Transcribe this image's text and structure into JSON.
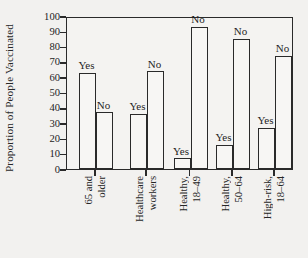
{
  "chart_data": {
    "type": "bar",
    "title": "",
    "subtitle": "",
    "xlabel": "",
    "ylabel": "Proportion of People Vaccinated",
    "ylim": [
      0,
      100
    ],
    "yticks": [
      0,
      10,
      20,
      30,
      40,
      50,
      60,
      70,
      80,
      90,
      100
    ],
    "ytick_labels": [
      "0",
      "10",
      "20",
      "30",
      "40",
      "50",
      "60",
      "70",
      "80",
      "90",
      "100"
    ],
    "grid": false,
    "legend": "none",
    "bar_style": {
      "fill": "#f7f6f4",
      "edge": "#2a2a2a"
    },
    "categories": [
      "65 and older",
      "Healthcare workers",
      "Healthy, 18–49",
      "Healthy, 50–64",
      "High-risk, 18–64"
    ],
    "category_label_lines": [
      [
        "65 and",
        "older"
      ],
      [
        "Healthcare",
        "workers"
      ],
      [
        "Healthy,",
        "18–49"
      ],
      [
        "Healthy,",
        "50–64"
      ],
      [
        "High-risk,",
        "18–64"
      ]
    ],
    "series": [
      {
        "name": "Yes",
        "values": [
          63,
          36,
          7,
          16,
          27
        ]
      },
      {
        "name": "No",
        "values": [
          37,
          64,
          93,
          85,
          74
        ]
      }
    ],
    "bars": [
      {
        "group": "65 and older",
        "answer": "Yes",
        "value": 63
      },
      {
        "group": "65 and older",
        "answer": "No",
        "value": 37
      },
      {
        "group": "Healthcare workers",
        "answer": "Yes",
        "value": 36
      },
      {
        "group": "Healthcare workers",
        "answer": "No",
        "value": 64
      },
      {
        "group": "Healthy, 18–49",
        "answer": "Yes",
        "value": 7
      },
      {
        "group": "Healthy, 18–49",
        "answer": "No",
        "value": 93
      },
      {
        "group": "Healthy, 50–64",
        "answer": "Yes",
        "value": 16
      },
      {
        "group": "Healthy, 50–64",
        "answer": "No",
        "value": 85
      },
      {
        "group": "High-risk, 18–64",
        "answer": "Yes",
        "value": 27
      },
      {
        "group": "High-risk, 18–64",
        "answer": "No",
        "value": 74
      }
    ]
  },
  "axis": {
    "y_title": "Proportion of People Vaccinated"
  }
}
